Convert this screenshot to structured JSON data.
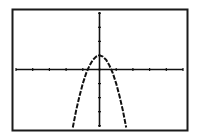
{
  "screen": {
    "type": "graphing-calculator-display",
    "frame_color": "#1a1a1a",
    "background": "#ffffff",
    "plot_color": "#111111"
  },
  "chart_data": {
    "type": "line",
    "title": "",
    "xlabel": "",
    "ylabel": "",
    "function": "y = 1 - 2x^2",
    "xlim": [
      -5,
      5
    ],
    "ylim": [
      -4.3,
      4.3
    ],
    "x_tick_step": 1,
    "y_tick_step": 1,
    "x_ticks": [
      -5,
      -4,
      -3,
      -2,
      -1,
      0,
      1,
      2,
      3,
      4,
      5
    ],
    "y_ticks": [
      -4,
      -3,
      -2,
      -1,
      0,
      1,
      2,
      3,
      4
    ],
    "grid": false,
    "legend": null,
    "series": [
      {
        "name": "parabola",
        "x": [
          -1.6,
          -1.4,
          -1.2,
          -1.0,
          -0.8,
          -0.6,
          -0.4,
          -0.2,
          0,
          0.2,
          0.4,
          0.6,
          0.8,
          1.0,
          1.2,
          1.4,
          1.6
        ],
        "y": [
          -4.12,
          -2.92,
          -1.88,
          -1.0,
          -0.28,
          0.28,
          0.68,
          0.92,
          1.0,
          0.92,
          0.68,
          0.28,
          -0.28,
          -1.0,
          -1.88,
          -2.92,
          -4.12
        ]
      }
    ],
    "key_points": {
      "vertex": [
        0,
        1
      ],
      "x_intercepts": [
        -0.71,
        0.71
      ]
    }
  }
}
